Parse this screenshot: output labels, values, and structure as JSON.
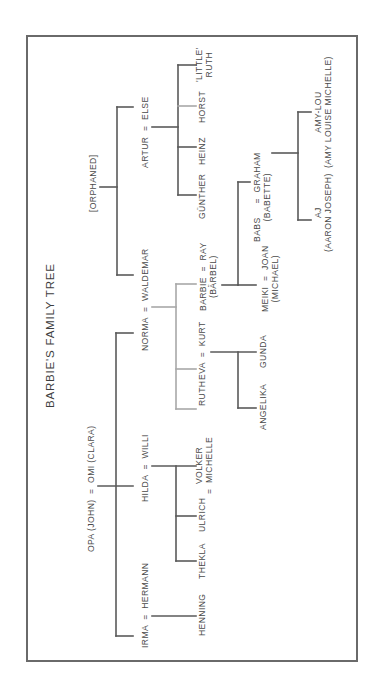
{
  "diagram": {
    "title": "BARBIE'S FAMILY TREE",
    "type": "family-tree",
    "orientation": "rotated-90-ccw",
    "colors": {
      "line": "#5a5a5a",
      "line_light": "#a8a8a8",
      "text": "#4a4a4a",
      "frame": "#6a6a6a"
    },
    "nodes": {
      "title": {
        "text": "BARBIE'S FAMILY TREE",
        "x": 45,
        "y": 408
      },
      "orphaned": {
        "text": "[ORPHANED]",
        "x": 88,
        "y": 212
      },
      "opa_omi": {
        "text": "OPA (JOHN)  =  OMI (CLARA)",
        "x": 86,
        "y": 552
      },
      "artur_else": {
        "text": "ARTUR  =  ELSE",
        "x": 140,
        "y": 168
      },
      "norma_waldemar": {
        "text": "NORMA  =  WALDEMAR",
        "x": 140,
        "y": 351
      },
      "hilda_willi": {
        "text": "HILDA  =  WILLI",
        "x": 140,
        "y": 502
      },
      "irma_hermann": {
        "text": "IRMA  =  HERMANN",
        "x": 140,
        "y": 648
      },
      "gunther": {
        "text": "GÜNTHER",
        "x": 197,
        "y": 219
      },
      "heinz": {
        "text": "HEINZ",
        "x": 197,
        "y": 165
      },
      "horst": {
        "text": "HORST",
        "x": 197,
        "y": 123
      },
      "little_ruth": {
        "text": "'LITTLE'\nRUTH",
        "x": 194,
        "y": 82
      },
      "barbie_ray": {
        "text": "BARBIE  =  RAY\n(BÄRBEL)",
        "x": 198,
        "y": 311
      },
      "eva_kurt": {
        "text": "EVA  =  KURT",
        "x": 197,
        "y": 380
      },
      "ruth": {
        "text": "RUTH",
        "x": 197,
        "y": 406
      },
      "volker_michelle": {
        "text": "VOLKER\n=  MICHELLE",
        "x": 194,
        "y": 494
      },
      "ulrich": {
        "text": "ULRICH",
        "x": 197,
        "y": 532
      },
      "thekla": {
        "text": "THEKLA",
        "x": 197,
        "y": 579
      },
      "henning": {
        "text": "HENNING",
        "x": 197,
        "y": 636
      },
      "babs_graham": {
        "text": "BABS     =  GRAHAM\n(BABETTE)",
        "x": 252,
        "y": 242
      },
      "meiki_joan": {
        "text": "MEIKI  =  JOAN\n(MICHAEL)",
        "x": 260,
        "y": 312
      },
      "gunda": {
        "text": "GUNDA",
        "x": 258,
        "y": 368
      },
      "angelika": {
        "text": "ANGELIKA",
        "x": 258,
        "y": 430
      },
      "aj": {
        "text": "AJ\n(AARON JOSEPH)",
        "x": 313,
        "y": 252
      },
      "amy_lou": {
        "text": "AMY-LOU\n(AMY LOUISE MICHELLE)",
        "x": 313,
        "y": 168
      }
    },
    "edges": [
      {
        "from": "orphaned",
        "to": [
          "artur_else",
          "norma_waldemar"
        ],
        "segments": [
          [
            100,
            187,
            117,
            187
          ],
          [
            117,
            107,
            117,
            275
          ],
          [
            117,
            107,
            133,
            107
          ],
          [
            117,
            275,
            133,
            275
          ]
        ],
        "light": false
      },
      {
        "from": "opa_omi",
        "to": [
          "norma_waldemar",
          "hilda_willi",
          "irma_hermann"
        ],
        "segments": [
          [
            116,
            333,
            116,
            636
          ],
          [
            116,
            333,
            133,
            333
          ],
          [
            116,
            636,
            133,
            636
          ],
          [
            98,
            486,
            133,
            486
          ]
        ],
        "light": false
      },
      {
        "from": "artur_else",
        "to": [
          "gunther",
          "heinz",
          "horst",
          "little_ruth"
        ],
        "segments": [
          [
            152,
            127,
            178,
            127
          ],
          [
            178,
            65,
            178,
            195
          ],
          [
            178,
            65,
            196,
            65
          ],
          [
            178,
            147,
            196,
            147
          ],
          [
            178,
            195,
            196,
            195
          ]
        ],
        "light": false
      },
      {
        "from": "artur_else",
        "to": [
          "horst"
        ],
        "segments": [
          [
            178,
            106,
            196,
            106
          ]
        ],
        "light": true
      },
      {
        "from": "norma_waldemar",
        "to": [
          "ruth",
          "eva_kurt",
          "barbie_ray"
        ],
        "segments": [
          [
            152,
            307,
            176,
            307
          ],
          [
            176,
            284,
            176,
            409
          ],
          [
            176,
            284,
            196,
            284
          ],
          [
            176,
            369,
            196,
            369
          ],
          [
            176,
            409,
            196,
            409
          ]
        ],
        "light": true
      },
      {
        "from": "hilda_willi",
        "to": [
          "thekla",
          "ulrich",
          "volker_michelle"
        ],
        "segments": [
          [
            152,
            466,
            196,
            466
          ],
          [
            176,
            466,
            176,
            561
          ],
          [
            176,
            516,
            196,
            516
          ],
          [
            176,
            561,
            196,
            561
          ]
        ],
        "light": false
      },
      {
        "from": "irma_hermann",
        "to": [
          "henning"
        ],
        "segments": [
          [
            152,
            616,
            196,
            616
          ]
        ],
        "light": false
      },
      {
        "from": "barbie_ray",
        "to": [
          "meiki_joan",
          "babs_graham"
        ],
        "segments": [
          [
            222,
            285,
            238,
            285
          ],
          [
            238,
            182,
            238,
            285
          ],
          [
            238,
            182,
            250,
            182
          ],
          [
            238,
            285,
            256,
            285
          ]
        ],
        "light": false
      },
      {
        "from": "eva_kurt",
        "to": [
          "gunda",
          "angelika"
        ],
        "segments": [
          [
            211,
            352,
            256,
            352
          ],
          [
            238,
            352,
            238,
            408
          ],
          [
            238,
            408,
            256,
            408
          ]
        ],
        "light": false
      },
      {
        "from": "babs_graham",
        "to": [
          "aj",
          "amy_lou"
        ],
        "segments": [
          [
            272,
            153,
            298,
            153
          ],
          [
            298,
            112,
            298,
            220
          ],
          [
            298,
            112,
            311,
            112
          ],
          [
            298,
            220,
            311,
            220
          ]
        ],
        "light": false
      }
    ]
  }
}
